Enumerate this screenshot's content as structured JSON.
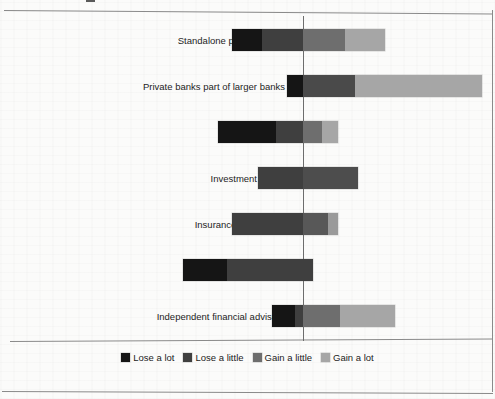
{
  "header": {
    "cropped_text": "",
    "note": "top line of page is cropped and illegible"
  },
  "legend": {
    "position": "bottom-center",
    "items": [
      {
        "label": "Lose a lot",
        "color": "#151515"
      },
      {
        "label": "Lose a little",
        "color": "#3f3f3f"
      },
      {
        "label": "Gain a little",
        "color": "#6e6e6e"
      },
      {
        "label": "Gain a lot",
        "color": "#a6a6a6"
      }
    ]
  },
  "chart_data": {
    "type": "bar",
    "subtype": "diverging-stacked-bar",
    "title": "",
    "xlabel": "",
    "ylabel": "",
    "grid": false,
    "legend_position": "bottom-center",
    "zero_line": true,
    "categories": [
      "Standalone private banks",
      "Private banks part of larger banks",
      "Retail banks",
      "Investment banks",
      "Insurance companies",
      "Stock brokers",
      "Independent financial advisors"
    ],
    "series": [
      {
        "name": "Lose a lot",
        "color": "#151515",
        "values": [
          30,
          16,
          58,
          0,
          0,
          44,
          31
        ]
      },
      {
        "name": "Lose a little",
        "color": "#3f3f3f",
        "values": [
          41,
          0,
          27,
          45,
          71,
          10,
          0
        ]
      },
      {
        "name": "Gain a little",
        "color": "#6e6e6e",
        "values": [
          42,
          52,
          19,
          55,
          25,
          0,
          37
        ]
      },
      {
        "name": "Gain a lot",
        "color": "#a6a6a6",
        "values": [
          40,
          127,
          16,
          0,
          10,
          0,
          55
        ]
      }
    ],
    "bars": [
      {
        "category": "Standalone private banks",
        "segments": [
          {
            "name": "Lose a lot",
            "start": 232,
            "end": 262,
            "color": "#151515"
          },
          {
            "name": "Lose a little",
            "start": 262,
            "end": 303,
            "color": "#3f3f3f"
          },
          {
            "name": "Gain a little",
            "start": 303,
            "end": 345,
            "color": "#6e6e6e"
          },
          {
            "name": "Gain a lot",
            "start": 345,
            "end": 385,
            "color": "#a6a6a6"
          }
        ]
      },
      {
        "category": "Private banks part of larger banks",
        "segments": [
          {
            "name": "Lose a lot",
            "start": 287,
            "end": 303,
            "color": "#151515"
          },
          {
            "name": "Gain a little",
            "start": 303,
            "end": 355,
            "color": "#4a4a4a"
          },
          {
            "name": "Gain a lot",
            "start": 355,
            "end": 482,
            "color": "#a6a6a6"
          }
        ]
      },
      {
        "category": "Retail banks",
        "segments": [
          {
            "name": "Lose a lot",
            "start": 218,
            "end": 276,
            "color": "#151515"
          },
          {
            "name": "Lose a little",
            "start": 276,
            "end": 303,
            "color": "#3f3f3f"
          },
          {
            "name": "Gain a little",
            "start": 303,
            "end": 322,
            "color": "#6e6e6e"
          },
          {
            "name": "Gain a lot",
            "start": 322,
            "end": 338,
            "color": "#a6a6a6"
          }
        ]
      },
      {
        "category": "Investment banks",
        "segments": [
          {
            "name": "Lose a little",
            "start": 258,
            "end": 303,
            "color": "#3f3f3f"
          },
          {
            "name": "Gain a little",
            "start": 303,
            "end": 358,
            "color": "#4d4d4d"
          }
        ]
      },
      {
        "category": "Insurance companies",
        "segments": [
          {
            "name": "Lose a little",
            "start": 232,
            "end": 303,
            "color": "#3f3f3f"
          },
          {
            "name": "Gain a little",
            "start": 303,
            "end": 328,
            "color": "#585858"
          },
          {
            "name": "Gain a lot",
            "start": 328,
            "end": 338,
            "color": "#9a9a9a"
          }
        ]
      },
      {
        "category": "Stock brokers",
        "segments": [
          {
            "name": "Lose a lot",
            "start": 183,
            "end": 227,
            "color": "#151515"
          },
          {
            "name": "Lose a little",
            "start": 227,
            "end": 313,
            "color": "#3f3f3f"
          }
        ]
      },
      {
        "category": "Independent financial advisors",
        "segments": [
          {
            "name": "Lose a lot",
            "start": 272,
            "end": 295,
            "color": "#151515"
          },
          {
            "name": "Lose a little",
            "start": 295,
            "end": 303,
            "color": "#3f3f3f"
          },
          {
            "name": "Gain a little",
            "start": 303,
            "end": 340,
            "color": "#6e6e6e"
          },
          {
            "name": "Gain a lot",
            "start": 340,
            "end": 395,
            "color": "#a6a6a6"
          }
        ]
      }
    ]
  },
  "layout": {
    "zero_x": 303,
    "row_tops": [
      24,
      70,
      116,
      162,
      208,
      254,
      300
    ],
    "bar_top_offset": 5,
    "label_right_margin": 285
  }
}
